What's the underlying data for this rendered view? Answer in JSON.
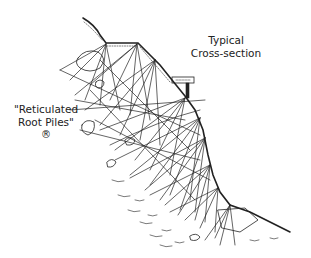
{
  "diagram": {
    "title_line1": "Typical",
    "title_line2": "Cross-section",
    "pile_label_line1": "\"Reticulated",
    "pile_label_line2": "Root Piles\"",
    "registered_mark": "®",
    "colors": {
      "ink": "#222222",
      "background": "#ffffff"
    },
    "elements": [
      "slope-profile",
      "root-pile-network",
      "retaining-structure",
      "boulders",
      "soil-strata"
    ]
  }
}
